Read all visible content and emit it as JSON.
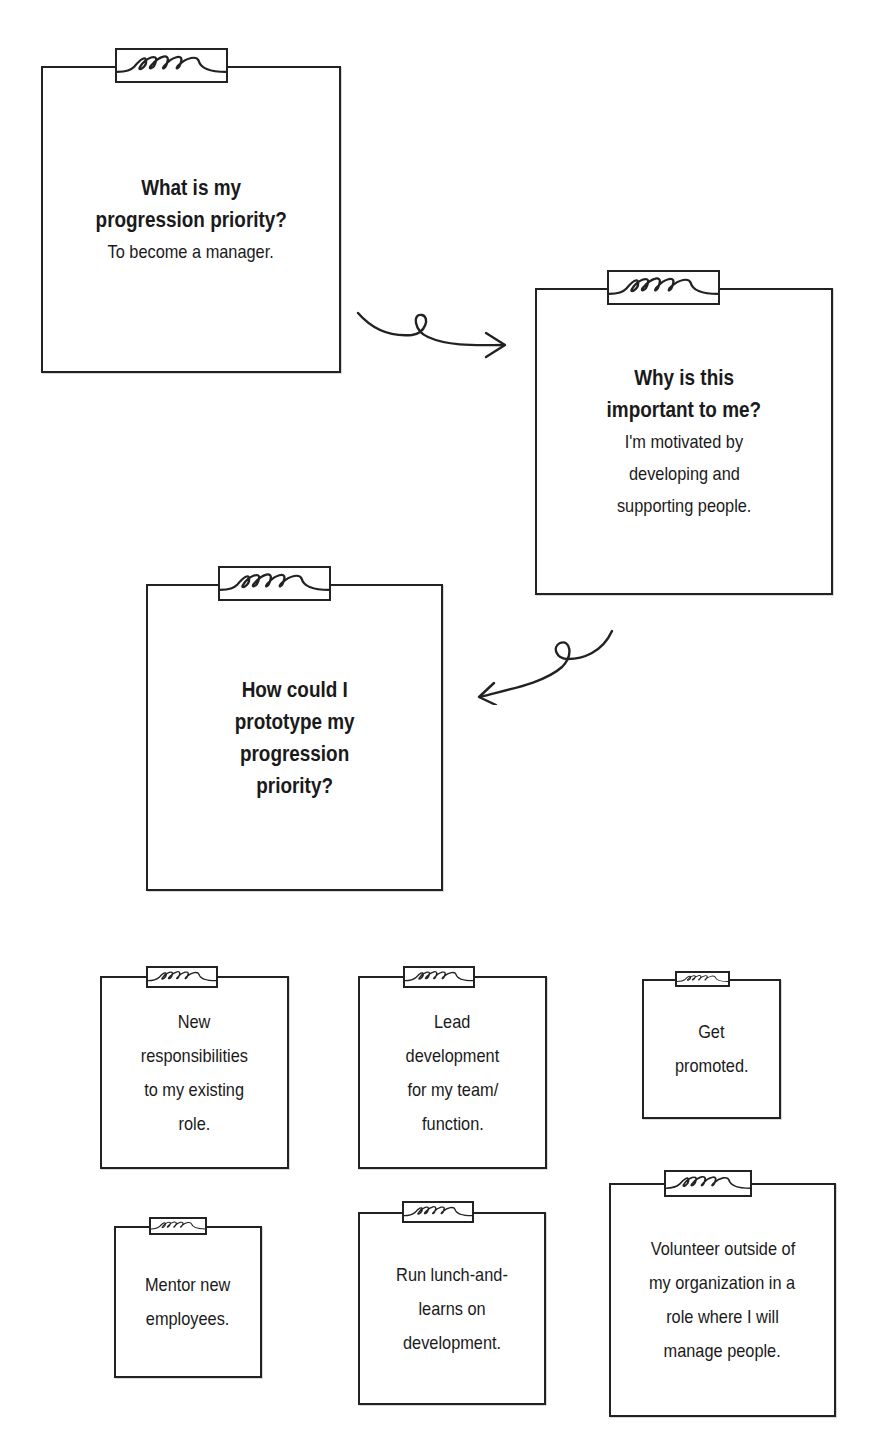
{
  "diagram": {
    "flow": [
      {
        "id": "step-1",
        "question": "What is my progression priority?",
        "question_lines": [
          "What is my",
          "progression priority?"
        ],
        "answer_lines": [
          "To become a manager."
        ]
      },
      {
        "id": "step-2",
        "question": "Why is this important to me?",
        "question_lines": [
          "Why is this",
          "important to me?"
        ],
        "answer_lines": [
          "I'm motivated by",
          "developing and",
          "supporting people."
        ]
      },
      {
        "id": "step-3",
        "question": "How could I prototype my progression priority?",
        "question_lines": [
          "How could I",
          "prototype my",
          "progression",
          "priority?"
        ],
        "answer_lines": []
      }
    ],
    "arrows": [
      {
        "from": "step-1",
        "to": "step-2",
        "direction": "right"
      },
      {
        "from": "step-2",
        "to": "step-3",
        "direction": "left"
      }
    ],
    "prototype_ideas": [
      {
        "lines": [
          "New",
          "responsibilities",
          "to my existing",
          "role."
        ]
      },
      {
        "lines": [
          "Lead",
          "development",
          "for my team/",
          "function."
        ]
      },
      {
        "lines": [
          "Get",
          "promoted."
        ]
      },
      {
        "lines": [
          "Mentor new",
          "employees."
        ]
      },
      {
        "lines": [
          "Run lunch-and-",
          "learns on",
          "development."
        ]
      },
      {
        "lines": [
          "Volunteer outside of",
          "my organization in a",
          "role where I will",
          "manage people."
        ]
      }
    ],
    "icons": {
      "clip": "paper-clip-coil-icon",
      "arrow": "curly-arrow-icon"
    },
    "colors": {
      "ink": "#222222",
      "paper": "#ffffff"
    }
  }
}
